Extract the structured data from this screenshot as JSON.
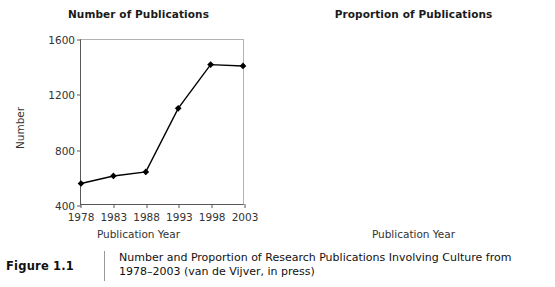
{
  "figure": {
    "label": "Figure 1.1",
    "caption_line1": "Number and Proportion of Research Publications Involving Culture from",
    "caption_line2": "1978–2003 (van de Vijver, in press)"
  },
  "chart_data": [
    {
      "type": "line",
      "title": "Number of Publications",
      "xlabel": "Publication Year",
      "ylabel": "Number",
      "x": [
        1978,
        1983,
        1988,
        1993,
        1998,
        2003
      ],
      "xticklabels": [
        "1978",
        "1983",
        "1988",
        "1993",
        "1998",
        "2003"
      ],
      "values": [
        550,
        605,
        635,
        1100,
        1420,
        1410
      ],
      "ylim": [
        400,
        1600
      ],
      "yticks": [
        400,
        800,
        1200,
        1600
      ],
      "yticklabels": [
        "400",
        "800",
        "1200",
        "1600"
      ],
      "grid": false,
      "marker": "diamond",
      "line_color": "#000000",
      "legend": null
    },
    {
      "type": "line",
      "title": "Proportion of Publications",
      "xlabel": "Publication Year",
      "ylabel": "Proportion",
      "x": [
        1978,
        1983,
        1988,
        1993,
        1998,
        2003
      ],
      "xticklabels": [
        "1978",
        "1983",
        "1988",
        "1993",
        "1998",
        "2003"
      ],
      "values": [
        0.0178,
        0.0144,
        0.0127,
        0.0176,
        0.0228,
        0.0215
      ],
      "ylim": [
        0.0,
        0.025
      ],
      "yticks": [
        0.0,
        0.005,
        0.01,
        0.015,
        0.02,
        0.025
      ],
      "yticklabels": [
        "0.000",
        "0.005",
        "0.010",
        "0.015",
        "0.020",
        "0.025"
      ],
      "grid": false,
      "marker": "diamond",
      "line_color": "#000000",
      "legend": null
    }
  ]
}
